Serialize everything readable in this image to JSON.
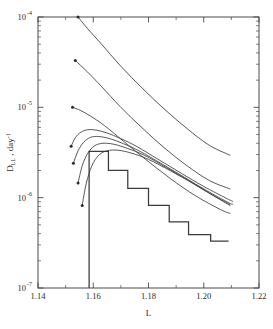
{
  "chart_data": {
    "type": "line",
    "title": "",
    "xlabel": "L",
    "ylabel": "D",
    "ylabel_sub": "LL",
    "ylabel_rest": " , day",
    "ylabel_sup": "-1",
    "yscale": "log",
    "xscale": "linear",
    "xlim": [
      1.14,
      1.22
    ],
    "ylim": [
      1e-07,
      0.0001
    ],
    "grid": false,
    "legend": null,
    "xticks": [
      1.14,
      1.16,
      1.18,
      1.2,
      1.22
    ],
    "xtick_labels": [
      "1.14",
      "1.16",
      "1.18",
      "1.20",
      "1.22"
    ],
    "xticks_minor": [
      1.15,
      1.17,
      1.19,
      1.21
    ],
    "yticks": [
      0.0001,
      1e-05,
      1e-06,
      1e-07
    ],
    "ytick_labels": [
      "10",
      "10",
      "10",
      "10"
    ],
    "ytick_exponents": [
      "-4",
      "-5",
      "-6",
      "-7"
    ],
    "yticks_minor": [
      2e-05,
      3e-05,
      4e-05,
      5e-05,
      6e-05,
      7e-05,
      8e-05,
      9e-05,
      2e-06,
      3e-06,
      4e-06,
      5e-06,
      6e-06,
      7e-06,
      8e-06,
      9e-06,
      2e-07,
      3e-07,
      4e-07,
      5e-07,
      6e-07,
      7e-07,
      8e-07,
      9e-07
    ],
    "series": [
      {
        "name": "steep-curve-1",
        "marker_at_start": true,
        "x": [
          1.1545,
          1.158,
          1.163,
          1.17,
          1.178,
          1.186,
          1.194,
          1.202,
          1.2095
        ],
        "values": [
          0.0001,
          7.4e-05,
          5e-05,
          2.85e-05,
          1.6e-05,
          9.4e-06,
          5.8e-06,
          3.8e-06,
          2.95e-06
        ]
      },
      {
        "name": "steep-curve-2",
        "marker_at_start": true,
        "x": [
          1.1535,
          1.158,
          1.163,
          1.17,
          1.178,
          1.186,
          1.194,
          1.202,
          1.2095
        ],
        "values": [
          3.3e-05,
          2.45e-05,
          1.7e-05,
          1e-05,
          5.8e-06,
          3.5e-06,
          2.25e-06,
          1.55e-06,
          1.25e-06
        ]
      },
      {
        "name": "steep-curve-3",
        "marker_at_start": true,
        "x": [
          1.1525,
          1.1555,
          1.159,
          1.164,
          1.171,
          1.179,
          1.188,
          1.197,
          1.206,
          1.2095
        ],
        "values": [
          1e-05,
          9.2e-06,
          8e-06,
          6.3e-06,
          4.2e-06,
          2.65e-06,
          1.62e-06,
          1.05e-06,
          7.4e-07,
          6.7e-07
        ]
      },
      {
        "name": "peaked-curve-1",
        "marker_at_start": true,
        "x": [
          1.152,
          1.1535,
          1.1555,
          1.158,
          1.161,
          1.165,
          1.17,
          1.176,
          1.184,
          1.192,
          1.2,
          1.208,
          1.2105
        ],
        "values": [
          3.7e-06,
          4.6e-06,
          5.3e-06,
          5.65e-06,
          5.6e-06,
          5.2e-06,
          4.5e-06,
          3.65e-06,
          2.6e-06,
          1.85e-06,
          1.33e-06,
          9.9e-07,
          9.1e-07
        ]
      },
      {
        "name": "peaked-curve-2",
        "marker_at_start": true,
        "x": [
          1.1528,
          1.1545,
          1.1565,
          1.159,
          1.162,
          1.166,
          1.171,
          1.177,
          1.185,
          1.193,
          1.201,
          1.209,
          1.2105
        ],
        "values": [
          2.4e-06,
          3.3e-06,
          4.1e-06,
          4.65e-06,
          4.75e-06,
          4.5e-06,
          3.95e-06,
          3.25e-06,
          2.35e-06,
          1.68e-06,
          1.2e-06,
          8.8e-07,
          8.5e-07
        ]
      },
      {
        "name": "peaked-curve-3",
        "marker_at_start": true,
        "x": [
          1.1545,
          1.156,
          1.158,
          1.1605,
          1.1635,
          1.1675,
          1.1725,
          1.1785,
          1.1865,
          1.1945,
          1.2025,
          1.2095
        ],
        "values": [
          1.45e-06,
          2.25e-06,
          3.1e-06,
          3.75e-06,
          4e-06,
          3.9e-06,
          3.5e-06,
          2.95e-06,
          2.15e-06,
          1.55e-06,
          1.1e-06,
          8.4e-07
        ]
      },
      {
        "name": "peaked-curve-4",
        "marker_at_start": true,
        "x": [
          1.156,
          1.1575,
          1.1595,
          1.162,
          1.165,
          1.169,
          1.174,
          1.18,
          1.188,
          1.196,
          1.204,
          1.2095
        ],
        "values": [
          8.2e-07,
          1.45e-06,
          2.25e-06,
          2.95e-06,
          3.3e-06,
          3.35e-06,
          3.1e-06,
          2.65e-06,
          1.98e-06,
          1.44e-06,
          1.03e-06,
          8.2e-07
        ]
      }
    ],
    "step_series": {
      "name": "staircase-histogram",
      "edges": [
        1.1585,
        1.1655,
        1.1725,
        1.18,
        1.1875,
        1.1945,
        1.2025,
        1.209
      ],
      "values": [
        3.25e-06,
        2e-06,
        1.27e-06,
        8.2e-07,
        5.4e-07,
        3.9e-07,
        3.3e-07
      ],
      "rise_from": 1e-07
    }
  },
  "figure": {
    "background": "#ffffff",
    "line_color": "#3a3a3a",
    "axis_color": "#4a4a4a",
    "text_color": "#2a2a2a"
  }
}
